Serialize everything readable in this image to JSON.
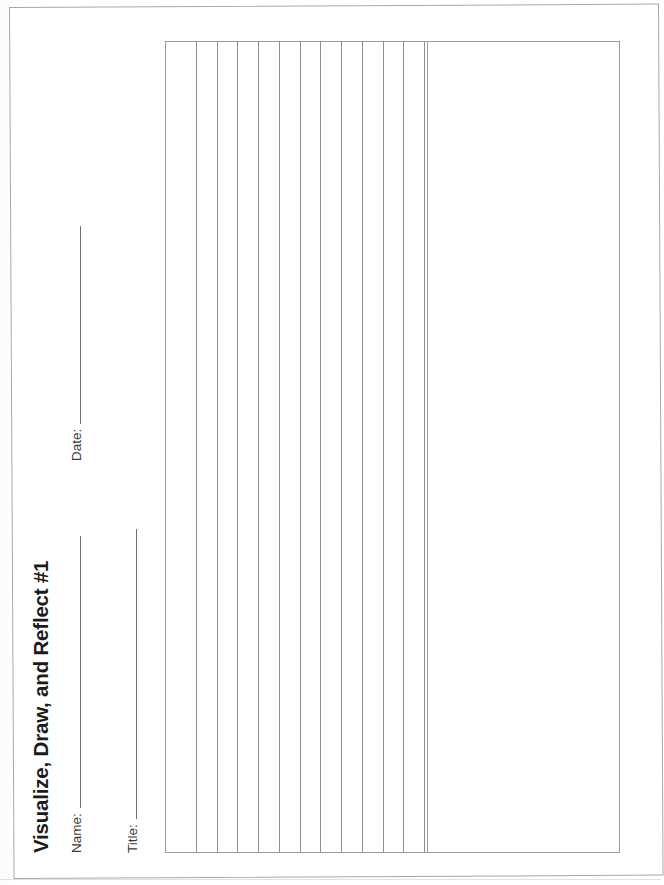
{
  "document": {
    "title": "Visualize, Draw, and Reflect #1",
    "orientation": "landscape-content-on-portrait-scan",
    "page_rotation_degrees": -90
  },
  "fields": [
    {
      "label": "Name:",
      "value": "",
      "has_write_line": true
    },
    {
      "label": "Date:",
      "value": "",
      "has_write_line": true
    },
    {
      "label": "Title:",
      "value": "",
      "has_write_line": true
    }
  ],
  "boxes": {
    "writing_area": {
      "name": "writing-area",
      "ruled": true,
      "rule_count": 12,
      "value": ""
    },
    "drawing_area": {
      "name": "drawing-area",
      "ruled": false,
      "value": ""
    }
  },
  "footer": {
    "scrap_text": "",
    "legible": false
  },
  "colors": {
    "ink": "#1b1b1b",
    "field_ink": "#3a3a3a",
    "border": "#9c9ca0",
    "rule": "#8e8e93",
    "page_border": "#a8a8ac",
    "paper": "#ffffff"
  }
}
